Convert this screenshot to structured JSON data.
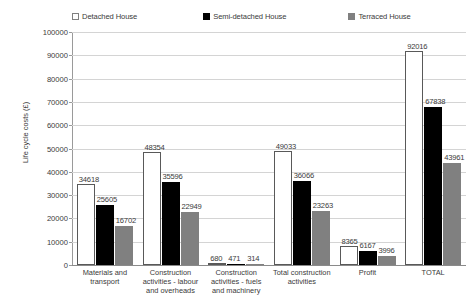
{
  "chart_data": {
    "type": "bar",
    "title": "",
    "xlabel": "",
    "ylabel": "Life cycle costs (£)",
    "ylim": [
      0,
      100000
    ],
    "ytick_step": 10000,
    "grid": true,
    "legend_position": "top",
    "categories": [
      "Materials and transport",
      "Construction activities - labour and overheads",
      "Construction activities - fuels and machinery",
      "Total construction activities",
      "Profit",
      "TOTAL"
    ],
    "series": [
      {
        "name": "Detached House",
        "color": "#ffffff",
        "values": [
          34618,
          48354,
          680,
          49033,
          8365,
          92016
        ]
      },
      {
        "name": "Semi-detached House",
        "color": "#000000",
        "values": [
          25605,
          35596,
          471,
          36066,
          6167,
          67838
        ]
      },
      {
        "name": "Terraced House",
        "color": "#808080",
        "values": [
          16702,
          22949,
          314,
          23263,
          3996,
          43961
        ]
      }
    ]
  },
  "axis": {
    "y_title": "Life cycle costs (£)",
    "y_ticks": [
      "100000",
      "90000",
      "80000",
      "70000",
      "60000",
      "50000",
      "40000",
      "30000",
      "20000",
      "10000",
      "0"
    ]
  },
  "legend": {
    "entries": [
      {
        "label": "Detached House",
        "swatch": "white-square-swatch"
      },
      {
        "label": "Semi-detached House",
        "swatch": "black-square-swatch"
      },
      {
        "label": "Terraced House",
        "swatch": "gray-square-swatch"
      }
    ]
  },
  "x_categories": [
    {
      "lines": [
        "Materials and",
        "transport"
      ]
    },
    {
      "lines": [
        "Construction",
        "activities - labour",
        "and overheads"
      ]
    },
    {
      "lines": [
        "Construction",
        "activities - fuels",
        "and machinery"
      ]
    },
    {
      "lines": [
        "Total construction",
        "activities"
      ]
    },
    {
      "lines": [
        "Profit"
      ]
    },
    {
      "lines": [
        "TOTAL"
      ]
    }
  ]
}
